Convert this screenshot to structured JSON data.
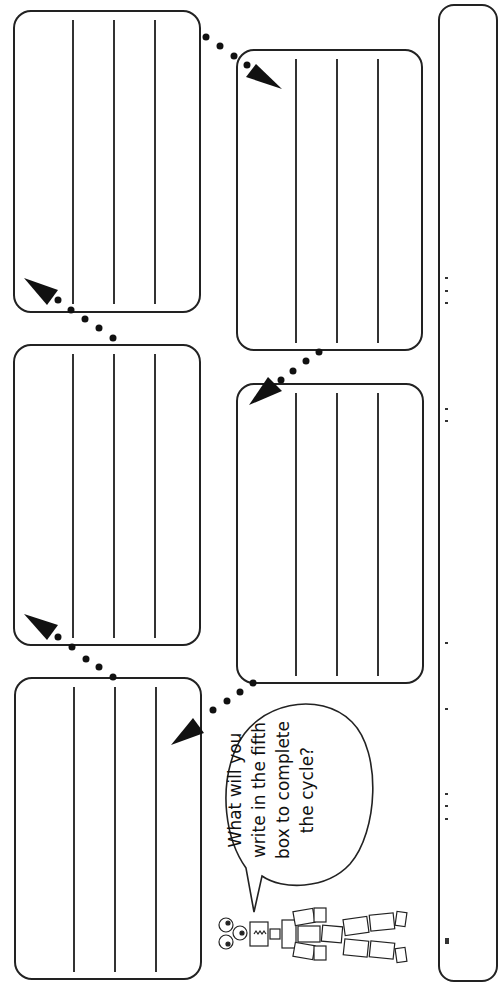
{
  "worksheet": {
    "title": "Cycle worksheet",
    "boxes": [
      {
        "id": 1,
        "lines": 3
      },
      {
        "id": 2,
        "lines": 3
      },
      {
        "id": 3,
        "lines": 3
      },
      {
        "id": 4,
        "lines": 3
      },
      {
        "id": 5,
        "lines": 3
      }
    ],
    "speech_bubble": {
      "lines": [
        "What will you",
        "write in the fifth",
        "box to complete",
        "the cycle?"
      ]
    },
    "character": "robot-made-of-tin-cans",
    "arrows": "dotted-arrow",
    "colors": {
      "ink": "#222222",
      "paper": "#ffffff"
    }
  }
}
